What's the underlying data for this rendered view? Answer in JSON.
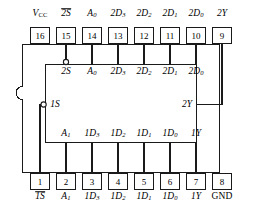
{
  "figure": {
    "package": {
      "type": "dual-in-line-package",
      "pin_count": 16,
      "notch_side": "left"
    },
    "colors": {
      "line": "#1a1a1a",
      "text": "#000000",
      "background": "#ffffff"
    }
  },
  "pins": {
    "top_row": [
      {
        "number": "16",
        "label_html": "V<sub class=\"sub-up\">CC</sub>",
        "overline": false,
        "italic": true
      },
      {
        "number": "15",
        "label_html": "2S",
        "overline": true,
        "italic": true
      },
      {
        "number": "14",
        "label_html": "A<sub>0</sub>",
        "overline": false,
        "italic": true
      },
      {
        "number": "13",
        "label_html": "2D<sub>3</sub>",
        "overline": false,
        "italic": true
      },
      {
        "number": "12",
        "label_html": "2D<sub>2</sub>",
        "overline": false,
        "italic": true
      },
      {
        "number": "11",
        "label_html": "2D<sub>1</sub>",
        "overline": false,
        "italic": true
      },
      {
        "number": "10",
        "label_html": "2D<sub>0</sub>",
        "overline": false,
        "italic": true
      },
      {
        "number": "9",
        "label_html": "2Y",
        "overline": false,
        "italic": true
      }
    ],
    "bottom_row": [
      {
        "number": "1",
        "label_html": "1S",
        "overline": true,
        "italic": true
      },
      {
        "number": "2",
        "label_html": "A<sub>1</sub>",
        "overline": false,
        "italic": true
      },
      {
        "number": "3",
        "label_html": "1D<sub>3</sub>",
        "overline": false,
        "italic": true
      },
      {
        "number": "4",
        "label_html": "1D<sub>2</sub>",
        "overline": false,
        "italic": true
      },
      {
        "number": "5",
        "label_html": "1D<sub>1</sub>",
        "overline": false,
        "italic": true
      },
      {
        "number": "6",
        "label_html": "1D<sub>0</sub>",
        "overline": false,
        "italic": true
      },
      {
        "number": "7",
        "label_html": "1Y",
        "overline": false,
        "italic": true
      },
      {
        "number": "8",
        "label_html": "GND",
        "overline": false,
        "italic": false
      }
    ]
  },
  "inner_block": {
    "top_labels": [
      {
        "text_html": "2S",
        "italic": true
      },
      {
        "text_html": "A<sub>0</sub>",
        "italic": true
      },
      {
        "text_html": "2D<sub>3</sub>",
        "italic": true
      },
      {
        "text_html": "2D<sub>2</sub>",
        "italic": true
      },
      {
        "text_html": "2D<sub>1</sub>",
        "italic": true
      },
      {
        "text_html": "2D<sub>0</sub>",
        "italic": true
      }
    ],
    "left_labels": [
      {
        "text_html": "1S",
        "italic": true
      }
    ],
    "right_labels": [
      {
        "text_html": "2Y",
        "italic": true
      }
    ],
    "bottom_labels": [
      {
        "text_html": "A<sub>1</sub>",
        "italic": true
      },
      {
        "text_html": "1D<sub>3</sub>",
        "italic": true
      },
      {
        "text_html": "1D<sub>2</sub>",
        "italic": true
      },
      {
        "text_html": "1D<sub>1</sub>",
        "italic": true
      },
      {
        "text_html": "1D<sub>0</sub>",
        "italic": true
      },
      {
        "text_html": "1Y",
        "italic": true
      }
    ],
    "inversion_bubbles": [
      {
        "at": "2S",
        "position": "top"
      },
      {
        "at": "1S",
        "position": "left"
      }
    ]
  }
}
